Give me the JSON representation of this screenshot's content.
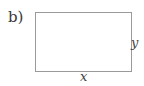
{
  "figure": {
    "part_label": "b)",
    "shape": "rectangle",
    "side_labels": {
      "width": "x",
      "height": "y"
    },
    "stroke_color": "#9a9a9a"
  }
}
